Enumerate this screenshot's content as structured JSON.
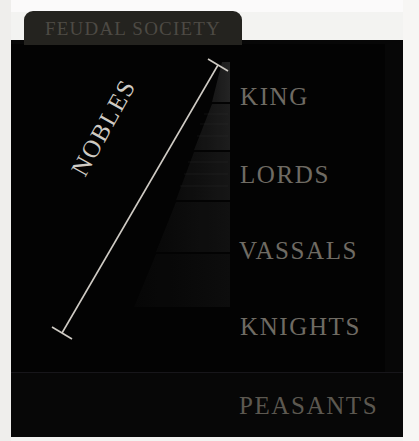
{
  "title": {
    "text": "FEUDAL SOCIETY"
  },
  "colors": {
    "board": "#070707",
    "board_inner": "#030303",
    "tab": "#24231f",
    "tab_text": "#4d4a44",
    "rank_text": "#6f6b63",
    "bracket": "#cfcbc4",
    "paper": "#f3f3f1"
  },
  "bracket": {
    "label": "NOBLES",
    "top_point": {
      "x": 218,
      "y": 65
    },
    "bottom_point": {
      "x": 62,
      "y": 333
    }
  },
  "hierarchy": {
    "ranks": [
      {
        "label": "KING",
        "level": 1
      },
      {
        "label": "LORDS",
        "level": 2
      },
      {
        "label": "VASSALS",
        "level": 3
      },
      {
        "label": "KNIGHTS",
        "level": 4
      },
      {
        "label": "PEASANTS",
        "level": 5
      }
    ]
  },
  "pyramid": {
    "name": "feudal-pyramid",
    "tiers": 5
  }
}
